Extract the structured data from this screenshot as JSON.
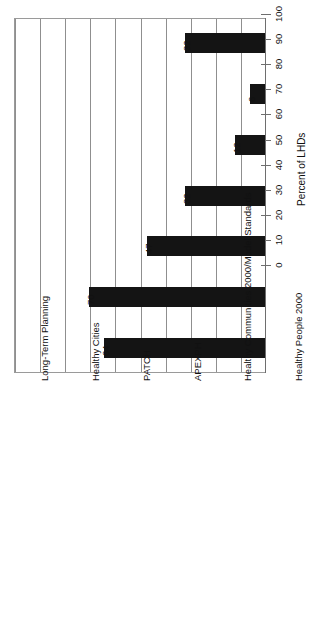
{
  "chart_data": {
    "type": "bar",
    "orientation": "vertical-rotated",
    "title": "",
    "subtitle": "",
    "xlabel": "",
    "ylabel": "Percent of LHDs",
    "ylim": [
      0,
      100
    ],
    "ytick_step": 10,
    "grid": true,
    "legend": false,
    "bar_color": "#141414",
    "categories": [
      "Long-Term Planning",
      "Healthy Cities",
      "PATCH",
      "APEXPH",
      "Healthy Communities 2000/Model Standards",
      "Healthy People 2000",
      "LHDs with a Long-Term Plan that Used a\nPlanning Model"
    ],
    "values": [
      32,
      6,
      12,
      32,
      47,
      70,
      64
    ],
    "tick_labels": [
      "0",
      "10",
      "20",
      "30",
      "40",
      "50",
      "60",
      "70",
      "80",
      "90",
      "100"
    ],
    "tick_values": [
      0,
      10,
      20,
      30,
      40,
      50,
      60,
      70,
      80,
      90,
      100
    ],
    "data_labels": [
      "32",
      "6",
      "12",
      "32",
      "47",
      "70",
      "64"
    ]
  },
  "axis": {
    "title": "Percent of LHDs"
  }
}
